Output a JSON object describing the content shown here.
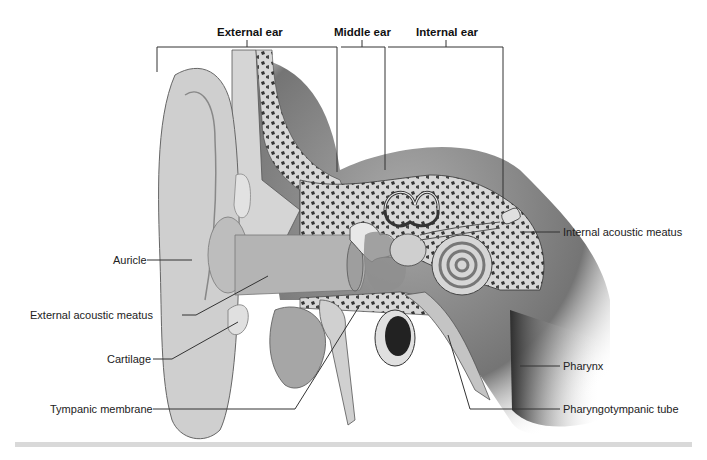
{
  "diagram": {
    "type": "labeled anatomical illustration",
    "region_headers": [
      {
        "label": "External ear"
      },
      {
        "label": "Middle ear"
      },
      {
        "label": "Internal ear"
      }
    ],
    "left_labels": [
      {
        "label": "Auricle"
      },
      {
        "label": "External acoustic meatus"
      },
      {
        "label": "Cartilage"
      },
      {
        "label": "Tympanic membrane"
      }
    ],
    "right_labels": [
      {
        "label": "Internal acoustic meatus"
      },
      {
        "label": "Pharynx"
      },
      {
        "label": "Pharyngotympanic tube"
      }
    ],
    "colors": {
      "line": "#333333",
      "skin": "#c8c8c8",
      "bone": "#e6e6e6",
      "spongy_bone": "#3a3a3a",
      "shadow": "#6a6a6a"
    }
  }
}
